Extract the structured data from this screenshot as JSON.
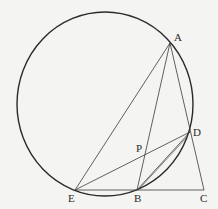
{
  "diagram": {
    "type": "geometry",
    "background": "#f4f4f2",
    "stroke_color": "#2a2a2a",
    "circle": {
      "cx": 105,
      "cy": 104,
      "rx": 88,
      "ry": 92
    },
    "points": {
      "A": {
        "label": "A",
        "x": 170,
        "y": 43,
        "lx": 174,
        "ly": 41
      },
      "D": {
        "label": "D",
        "x": 190,
        "y": 132,
        "lx": 193,
        "ly": 136
      },
      "P": {
        "label": "P",
        "x": 142,
        "y": 153,
        "lx": 136,
        "ly": 152
      },
      "E": {
        "label": "E",
        "x": 75,
        "y": 190,
        "lx": 68,
        "ly": 202
      },
      "B": {
        "label": "B",
        "x": 137,
        "y": 190,
        "lx": 134,
        "ly": 202
      },
      "C": {
        "label": "C",
        "x": 204,
        "y": 190,
        "lx": 200,
        "ly": 202
      }
    },
    "segments": [
      {
        "name": "AE",
        "from": "A",
        "to": "E"
      },
      {
        "name": "AB",
        "from": "A",
        "to": "B"
      },
      {
        "name": "AC",
        "from": "A",
        "to": "C"
      },
      {
        "name": "ED",
        "from": "E",
        "to": "D"
      },
      {
        "name": "BD",
        "from": "B",
        "to": "D"
      },
      {
        "name": "EC",
        "from": "E",
        "to": "C"
      }
    ]
  }
}
